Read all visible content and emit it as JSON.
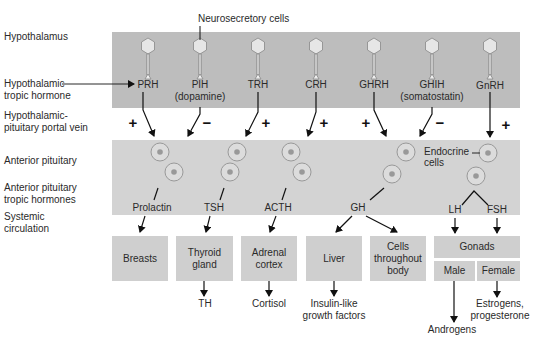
{
  "row_labels": {
    "hypothalamus": "Hypothalamus",
    "tropic_hormone_1": "Hypothalamic",
    "tropic_hormone_2": "tropic hormone",
    "portal_vein_1": "Hypothalamic-",
    "portal_vein_2": "pituitary portal vein",
    "anterior_pituitary": "Anterior pituitary",
    "ap_tropic_1": "Anterior pituitary",
    "ap_tropic_2": "tropic hormones",
    "systemic_1": "Systemic",
    "systemic_2": "circulation"
  },
  "annotations": {
    "neurosecretory_cells": "Neurosecretory cells",
    "endocrine_cells_1": "Endocrine",
    "endocrine_cells_2": "cells"
  },
  "hypothalamic_hormones": [
    {
      "name": "PRH",
      "sub": "",
      "effect": "+"
    },
    {
      "name": "PIH",
      "sub": "(dopamine)",
      "effect": "−"
    },
    {
      "name": "TRH",
      "sub": "",
      "effect": "+"
    },
    {
      "name": "CRH",
      "sub": "",
      "effect": "+"
    },
    {
      "name": "GHRH",
      "sub": "",
      "effect": "+"
    },
    {
      "name": "GHIH",
      "sub": "(somatostatin)",
      "effect": "−"
    },
    {
      "name": "GnRH",
      "sub": "",
      "effect": "+"
    }
  ],
  "pituitary_hormones": [
    "Prolactin",
    "TSH",
    "ACTH",
    "GH",
    "LH",
    "FSH"
  ],
  "targets": {
    "breasts": "Breasts",
    "thyroid_1": "Thyroid",
    "thyroid_2": "gland",
    "adrenal_1": "Adrenal",
    "adrenal_2": "cortex",
    "liver": "Liver",
    "cells_1": "Cells",
    "cells_2": "throughout",
    "cells_3": "body",
    "gonads": "Gonads",
    "male": "Male",
    "female": "Female"
  },
  "products": {
    "th": "TH",
    "cortisol": "Cortisol",
    "igf_1": "Insulin-like",
    "igf_2": "growth factors",
    "androgens": "Androgens",
    "estrogens_1": "Estrogens,",
    "estrogens_2": "progesterone"
  },
  "colors": {
    "hypothalamus_band": "#bdbdbd",
    "pituitary_band": "#d3d3d3",
    "target_box": "#cfcfcf",
    "arrow": "#111111"
  }
}
